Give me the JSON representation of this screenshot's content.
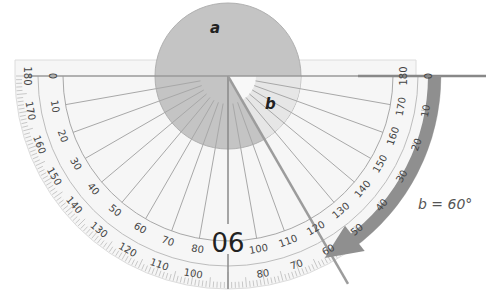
{
  "diagram": {
    "title": "",
    "labels": {
      "angle_a": "a",
      "angle_b": "b",
      "annotation": "b = 60°",
      "center_label": "90"
    },
    "protractor": {
      "outer_scale": [
        "180",
        "170",
        "160",
        "150",
        "140",
        "130",
        "120",
        "110",
        "100",
        "90",
        "80",
        "70",
        "60",
        "50",
        "40",
        "30",
        "20",
        "10",
        "0"
      ],
      "inner_scale": [
        "0",
        "10",
        "20",
        "30",
        "40",
        "50",
        "60",
        "70",
        "80",
        "90",
        "100",
        "110",
        "120",
        "130",
        "140",
        "150",
        "160",
        "170",
        "180"
      ],
      "measured_angle_deg": 60
    },
    "colors": {
      "angle_a_fill": "#c4c4c4",
      "angle_b_fill": "#e6e6e6",
      "arrow": "#8f8f8f",
      "lines": "#a8a8a8",
      "protractor_bg": "#f6f6f6",
      "text": "#444444"
    }
  }
}
